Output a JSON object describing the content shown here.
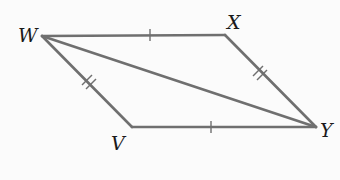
{
  "figure": {
    "type": "parallelogram",
    "vertices": {
      "W": {
        "label": "W",
        "x": 42,
        "y": 36
      },
      "X": {
        "label": "X",
        "x": 225,
        "y": 35
      },
      "Y": {
        "label": "Y",
        "x": 316,
        "y": 127
      },
      "V": {
        "label": "V",
        "x": 132,
        "y": 127
      }
    },
    "segments": [
      {
        "from": "W",
        "to": "X",
        "ticks": 1
      },
      {
        "from": "X",
        "to": "Y",
        "ticks": 2
      },
      {
        "from": "Y",
        "to": "V",
        "ticks": 1
      },
      {
        "from": "V",
        "to": "W",
        "ticks": 2
      },
      {
        "from": "W",
        "to": "Y",
        "ticks": 0,
        "role": "diagonal"
      }
    ],
    "colors": {
      "line": "#6f6f6f",
      "label": "#1a1a1a",
      "background": "#fbfbfb"
    }
  }
}
